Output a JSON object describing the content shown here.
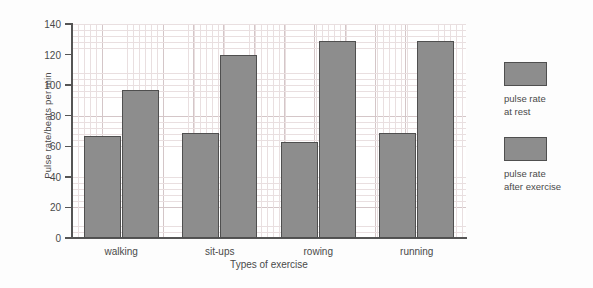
{
  "chart_data": {
    "type": "bar",
    "title": "",
    "xlabel": "Types of exercise",
    "ylabel": "Pulse rate/beats per min",
    "categories": [
      "walking",
      "sit-ups",
      "rowing",
      "running"
    ],
    "series": [
      {
        "name": "pulse rate\nat rest",
        "values": [
          67,
          69,
          63,
          69
        ]
      },
      {
        "name": "pulse rate\nafter exercise",
        "values": [
          97,
          120,
          129,
          129
        ]
      }
    ],
    "ylim": [
      0,
      140
    ],
    "ytick_labels": [
      "0",
      "20",
      "40",
      "60",
      "80",
      "100",
      "120",
      "140"
    ],
    "ytick_values": [
      0,
      20,
      40,
      60,
      80,
      100,
      120,
      140
    ],
    "grid": true,
    "grid_minor": true,
    "legend_position": "right",
    "bar_color": "#8d8d8d",
    "bar_edge_color": "#4f4f4f",
    "grid_color": "#e9dfe0",
    "grid_major_color": "#d4c6c8",
    "axis_color": "#555555",
    "background": "#ffffff"
  },
  "legend": {
    "items": [
      {
        "label": "pulse rate\nat rest"
      },
      {
        "label": "pulse rate\nafter exercise"
      }
    ]
  }
}
